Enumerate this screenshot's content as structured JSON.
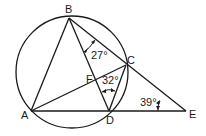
{
  "diagram": {
    "type": "circle-geometry",
    "circle": {
      "cx": 72,
      "cy": 72,
      "r": 56
    },
    "points": {
      "A": {
        "label": "A",
        "x": 31,
        "y": 111
      },
      "B": {
        "label": "B",
        "x": 69,
        "y": 18
      },
      "C": {
        "label": "C",
        "x": 126,
        "y": 65
      },
      "D": {
        "label": "D",
        "x": 109,
        "y": 111
      },
      "E": {
        "label": "E",
        "x": 186,
        "y": 111
      },
      "F": {
        "label": "F",
        "x": 100,
        "y": 80
      }
    },
    "segments": [
      "AB",
      "BD",
      "BE",
      "AC",
      "CD",
      "AE"
    ],
    "angles": [
      {
        "name": "angle-DBC",
        "label": "27°",
        "vertex": "B"
      },
      {
        "name": "angle-BDC",
        "label": "32°",
        "vertex": "D"
      },
      {
        "name": "angle-CED",
        "label": "39°",
        "vertex": "E"
      }
    ],
    "stroke_color": "#1a1a1a"
  }
}
